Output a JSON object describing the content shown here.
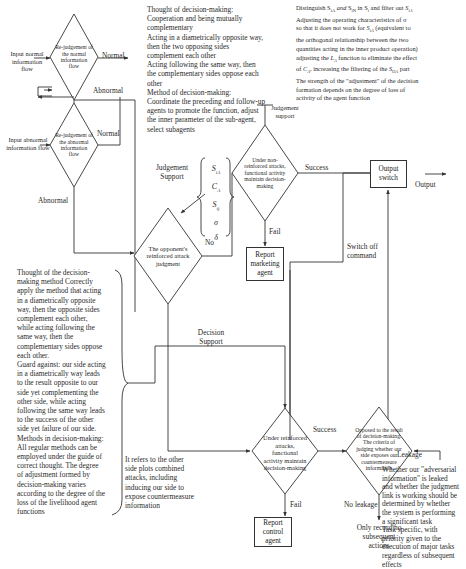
{
  "diagram": {
    "decisions": {
      "rejudge_normal": "Re-judgement of the normal information flow",
      "rejudge_abnormal": "Re-judgement of the abnormal information flow",
      "opponent_attack": "The opponent's reinforced attack judgment",
      "non_reinforced": "Under non-reinforced attacks, functional activity maintain decision-making",
      "reinforced": "Under reinforced attacks, functional activity maintain decision-making",
      "leak_criteria": "Opposed to the result of decision-making. The criteria of judging whether our side exposes our countermeasure information"
    },
    "boxes": {
      "report_marketing": "Report marketing agent",
      "report_control": "Report control agent",
      "output_switch": "Output switch"
    },
    "inputs": {
      "normal": "Input normal information flow",
      "abnormal": "Input abnormal information flow"
    },
    "edge_labels": {
      "normal_1": "Normal",
      "abnormal_1": "Abnormal",
      "normal_2": "Normal",
      "abnormal_2": "Abnormal",
      "judgement_support_top": "Judgement support",
      "judgement_support_left": "Judgement Support",
      "no": "No",
      "success_1": "Success",
      "fail_1": "Fail",
      "output": "Output",
      "switch_off": "Switch off command",
      "decision_support": "Decision Support",
      "success_2": "Success",
      "fail_2": "Fail",
      "leakage": "Leakage",
      "no_leakage": "No leakage",
      "only_record": "Only record no subsequent actions"
    },
    "parameters": [
      "S_{iA}",
      "C_A",
      "S_{ij}",
      "σ",
      "δ"
    ],
    "notes": {
      "thought_top": [
        "Thought of decision-making:",
        "Cooperation and being mutually",
        "complementary",
        "Acting in a diametrically opposite way,",
        "then the two opposing sides",
        "complement each other",
        "Acting following the same way, then",
        "the complementary sides oppose each",
        "other",
        "Method of decision-making:",
        "Coordinate the preceding and follow-up",
        "agents to promote the function, adjust",
        "the inner parameter of the sub-agent,",
        "select subagents"
      ],
      "distinguish_top_right": [
        "Distinguish S_iA and S_iN in S_i and filter out S_iA",
        "Adjusting the operating characteristics of σ",
        "so that it does not work for S_iA (equivalent to",
        "the orthogonal relationship between the two",
        "quantities acting in the inner product operation)",
        "adjusting the L_A function to eliminate the effect",
        "of C_A, increasing the filtering of the S_OA part",
        "The strength of the \"adjustment\" of the decision",
        "formation depends on the degree of loss of",
        "activity of the agent function"
      ],
      "left_method": [
        "Thought of the decision-",
        "making method Correctly",
        "apply the method that acting",
        "in a diametrically opposite",
        "way, then the opposite sides",
        "complement each other,",
        "while acting following the",
        "same way, then the",
        "complementary sides oppose",
        "each other.",
        "Guard against: our side acting",
        "in a diametrically way leads",
        "to the result  opposite to our",
        "side yet complementing the",
        "other side, while acting",
        "following the same way leads",
        "to the success of the other",
        "side yet failure of our side.",
        "Methods in decision-making:",
        "All regular methods can be",
        "employed under the guide of",
        "correct thought. The degree",
        "of adjustment formed by",
        "decision-making varies",
        "according to the degree of the",
        "loss of the livelihood agent",
        "functions"
      ],
      "other_side": [
        "It refers to the other",
        "side plots combined",
        "attacks, including",
        "inducing our side to",
        "expose countermeasure",
        "information"
      ],
      "adversarial": [
        "Whether our \"adversarial",
        "information\" is leaked",
        "and whether the judgment",
        "link is working should be",
        "determined by whether",
        "the system is performing",
        "a significant task",
        "Task specific, with",
        "priority given to the",
        "execution of major tasks",
        "regardless of subsequent",
        "effects"
      ]
    },
    "colors": {
      "line": "#333333",
      "text": "#2a2a2a",
      "background": "#ffffff"
    }
  }
}
